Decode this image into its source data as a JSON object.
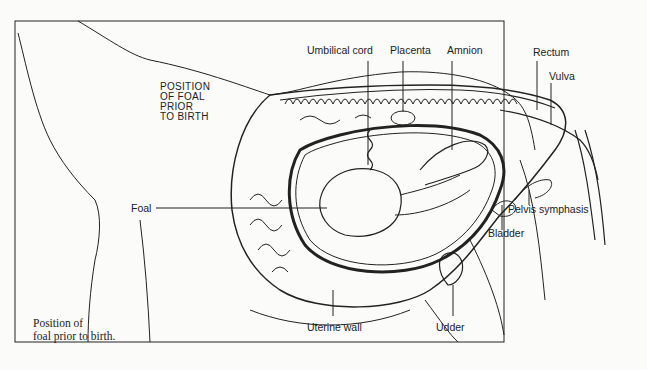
{
  "diagram": {
    "heading_lines": [
      "POSITION",
      "OF FOAL",
      "PRIOR",
      "TO BIRTH"
    ],
    "caption_lines": [
      "Position of",
      "foal prior to birth."
    ],
    "labels": {
      "umbilical_cord": "Umbilical cord",
      "placenta": "Placenta",
      "amnion": "Amnion",
      "rectum": "Rectum",
      "vulva": "Vulva",
      "foal": "Foal",
      "pelvis_symphasis": "Pelvis symphasis",
      "bladder": "Bladder",
      "uterine_wall": "Uterine wall",
      "udder": "Udder"
    },
    "colors": {
      "line": "#222222",
      "background": "#fbfbfa"
    }
  }
}
